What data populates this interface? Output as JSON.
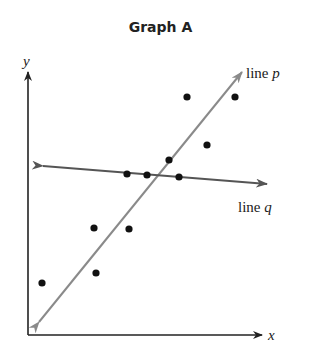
{
  "title": "Graph A",
  "axes": {
    "x_label": "x",
    "y_label": "y",
    "origin": [
      28,
      335
    ],
    "x_end": [
      262,
      335
    ],
    "y_end": [
      28,
      72
    ]
  },
  "lines": [
    {
      "name": "p",
      "label_prefix": "line ",
      "label_var": "p",
      "color": "#8a8a8a",
      "from": [
        39,
        322
      ],
      "to": [
        242,
        72
      ],
      "label_pos": [
        246,
        78
      ]
    },
    {
      "name": "q",
      "label_prefix": "line ",
      "label_var": "q",
      "color": "#555555",
      "from": [
        43,
        166
      ],
      "to": [
        267,
        184
      ],
      "label_pos": [
        238,
        212
      ]
    }
  ],
  "points": [
    [
      187,
      97
    ],
    [
      235,
      97
    ],
    [
      207,
      145
    ],
    [
      169,
      160
    ],
    [
      127,
      174
    ],
    [
      147,
      175
    ],
    [
      179,
      177
    ],
    [
      94,
      228
    ],
    [
      129,
      229
    ],
    [
      96,
      273
    ],
    [
      42,
      283
    ]
  ],
  "colors": {
    "axis": "#222222",
    "point": "#111111"
  }
}
